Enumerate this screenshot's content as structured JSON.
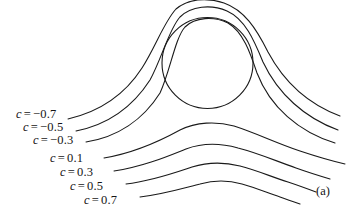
{
  "figure": {
    "panel_label": "(a)",
    "panel_label_pos": {
      "x": 316,
      "y": 184
    },
    "background_color": "#ffffff",
    "line_color": "#1a1a1a",
    "line_width": 1.1,
    "width": 358,
    "height": 212
  },
  "obstacle": {
    "name": "circle",
    "cx": 207.5,
    "cy": 63,
    "r": 45.5
  },
  "labels": [
    {
      "var": "c",
      "eq": "=",
      "value": "−0.7",
      "x": 16,
      "y": 108
    },
    {
      "var": "c",
      "eq": "=",
      "value": "−0.5",
      "x": 23,
      "y": 121
    },
    {
      "var": "c",
      "eq": "=",
      "value": "−0.3",
      "x": 33,
      "y": 134
    },
    {
      "var": "c",
      "eq": "=",
      "value": "0.1",
      "x": 50,
      "y": 152
    },
    {
      "var": "c",
      "eq": "=",
      "value": "0.3",
      "x": 60,
      "y": 166
    },
    {
      "var": "c",
      "eq": "=",
      "value": "0.5",
      "x": 70,
      "y": 180
    },
    {
      "var": "c",
      "eq": "=",
      "value": "0.7",
      "x": 84,
      "y": 194
    }
  ],
  "chart_data": {
    "type": "line",
    "title": "",
    "subtitle": "",
    "xlabel": "",
    "ylabel": "",
    "grid": false,
    "legend_position": "inline-labels",
    "contour_levels": [
      -0.7,
      -0.5,
      -0.3,
      0.1,
      0.3,
      0.5,
      0.7
    ],
    "series": [
      {
        "name": "c = -0.7",
        "value": -0.7,
        "path": "M 68,119 C 98,112 124,96 142,68 C 156,46 164,22 176,9 C 188,-1 206,-3 224,3 C 244,10 256,28 268,52 C 284,82 308,104 340,116"
      },
      {
        "name": "c = -0.5",
        "value": -0.5,
        "path": "M 76,131 C 106,125 132,108 150,80 C 162,58 169,29 180,17 C 191,6 211,4 227,11 C 245,19 254,40 263,62 C 278,94 305,118 338,130"
      },
      {
        "name": "c = -0.3",
        "value": -0.3,
        "path": "M 86,142 C 117,137 143,120 160,93 C 170,72 175,38 185,27 C 195,17 214,16 228,23 C 243,32 250,52 257,73 C 270,107 299,132 335,143"
      },
      {
        "name": "c = 0.1",
        "value": 0.1,
        "path": "M 104,158 C 134,153 160,141 180,130 C 196,122 216,121 234,126 C 256,133 276,143 300,151 C 318,157 332,161 345,164"
      },
      {
        "name": "c = 0.3",
        "value": 0.3,
        "path": "M 114,171 C 142,167 166,157 186,149 C 202,143 220,143 238,148 C 258,153 276,161 296,168 C 310,173 320,176 330,179"
      },
      {
        "name": "c = 0.5",
        "value": 0.5,
        "path": "M 126,184 C 152,181 174,173 192,167 C 208,162 224,162 240,166 C 256,170 272,177 288,182 C 300,186 308,189 316,192"
      },
      {
        "name": "c = 0.7",
        "value": 0.7,
        "path": "M 140,197 C 164,194 184,188 200,184 C 214,180 228,180 242,184 C 256,188 268,193 280,197 C 288,200 294,202 300,204"
      }
    ]
  }
}
